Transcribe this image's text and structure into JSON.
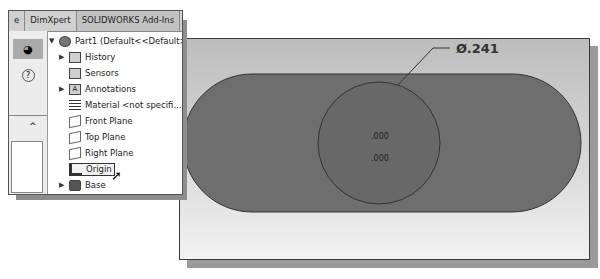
{
  "tabs": [
    {
      "label": "e"
    },
    {
      "label": "DimXpert"
    },
    {
      "label": "SOLIDWORKS Add-Ins"
    }
  ],
  "left_strip": {
    "buttons": [
      {
        "icon": "appearance-icon",
        "glyph": "◕"
      },
      {
        "icon": "help-icon",
        "glyph": "?"
      }
    ],
    "collapse_glyph": "^"
  },
  "tree": {
    "root": {
      "label": "Part1  (Default<<Default>..."
    },
    "items": [
      {
        "label": "History",
        "icon": "history-icon",
        "expandable": true
      },
      {
        "label": "Sensors",
        "icon": "sensors-icon",
        "expandable": false
      },
      {
        "label": "Annotations",
        "icon": "annotations-icon",
        "expandable": true
      },
      {
        "label": "Material <not specifi...",
        "icon": "material-icon",
        "expandable": false
      },
      {
        "label": "Front Plane",
        "icon": "plane-icon",
        "expandable": false
      },
      {
        "label": "Top Plane",
        "icon": "plane-icon",
        "expandable": false
      },
      {
        "label": "Right Plane",
        "icon": "plane-icon",
        "expandable": false
      },
      {
        "label": "Origin",
        "icon": "origin-icon",
        "expandable": false,
        "hovered": true
      },
      {
        "label": "Base",
        "icon": "body-icon",
        "expandable": true
      }
    ]
  },
  "viewport": {
    "dimension_label": "Ø.241",
    "coord_x": ".000",
    "coord_y": ".000",
    "colors": {
      "slot_fill": "#6e6e6e",
      "circle_fill": "#686868",
      "outline": "#333333"
    }
  }
}
